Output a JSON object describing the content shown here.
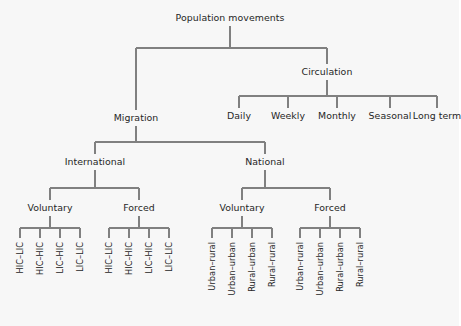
{
  "diagram": {
    "type": "tree",
    "title": "Population movements",
    "style": {
      "background": "#f7f7f7",
      "line_color": "#808080",
      "text_color": "#262626"
    },
    "nodes": {
      "root": "Population movements",
      "migration": "Migration",
      "circulation": "Circulation",
      "international": "International",
      "national": "National",
      "intl_voluntary": "Voluntary",
      "intl_forced": "Forced",
      "natl_voluntary": "Voluntary",
      "natl_forced": "Forced"
    },
    "circulation_children": [
      "Daily",
      "Weekly",
      "Monthly",
      "Seasonal",
      "Long term"
    ],
    "intl_voluntary_leaves": [
      "HIC–LIC",
      "HIC–HIC",
      "LIC–HIC",
      "LIC–LIC"
    ],
    "intl_forced_leaves": [
      "HIC–LIC",
      "HIC–HIC",
      "LIC–HIC",
      "LIC–LIC"
    ],
    "natl_voluntary_leaves": [
      "Urban–rural",
      "Urban–urban",
      "Rural–urban",
      "Rural–rural"
    ],
    "natl_forced_leaves": [
      "Urban–rural",
      "Urban–urban",
      "Rural–urban",
      "Rural–rural"
    ]
  }
}
